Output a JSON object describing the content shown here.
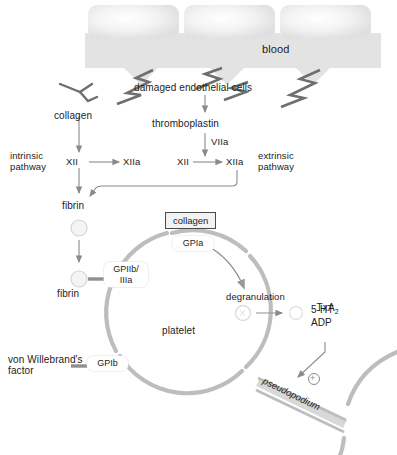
{
  "diagram": {
    "colors": {
      "vessel_fill": "#e3e3e3",
      "cell_fill": "#ececec",
      "membrane": "#b9b9b9",
      "arrow": "#7d7d7d",
      "bolt": "#6e6e6e",
      "text": "#1c1c1c",
      "granule": "#dedede"
    }
  },
  "vessel": {
    "blood_label": "blood",
    "endothelial_cells_count": 3,
    "damaged_label": "damaged endothelial cells",
    "bolts": 4
  },
  "intrinsic": {
    "collagen_label": "collagen",
    "pathway_label": "intrinsic\npathway",
    "factor_in": "XII",
    "factor_out": "XIIa"
  },
  "extrinsic": {
    "thromboplastin_label": "thromboplastin",
    "cofactor": "VIIa",
    "factor_in": "XII",
    "factor_out": "XIIa",
    "pathway_label": "extrinsic\npathway"
  },
  "fibrin": {
    "label_top": "fibrin",
    "label_bound": "fibrin"
  },
  "platelet": {
    "label": "platelet",
    "collagen_box": "collagen",
    "receptors": [
      {
        "name": "GPIa",
        "id": "gpia"
      },
      {
        "name": "GPIIb/\nIIIa",
        "id": "gpiibiiia"
      },
      {
        "name": "GPIb",
        "id": "gpib"
      }
    ],
    "vwf_label": "von Willebrand's\nfactor",
    "degranulation_label": "degranulation",
    "mediators": [
      "TxA",
      "5-HT",
      "ADP"
    ],
    "txa_subscript": "2",
    "pseudopodium_label": "pseudopodium",
    "plus_sign": "+"
  }
}
